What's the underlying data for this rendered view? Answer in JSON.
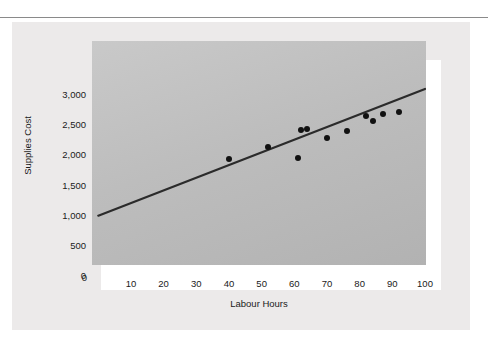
{
  "figure": {
    "title": "Scattergraph",
    "background_color": "#eceaea",
    "plot_fill_color": "#bdbdbd",
    "frame_color": "#ffffff",
    "point_color": "#111111",
    "line_color": "#2b2b2b"
  },
  "chart_data": {
    "type": "scatter",
    "title": "Scattergraph",
    "xlabel": "Labour Hours",
    "ylabel": "Supplies Cost",
    "xlim": [
      0,
      100
    ],
    "ylim": [
      0,
      3150
    ],
    "grid": false,
    "legend": "none",
    "xticks": [
      0,
      10,
      20,
      30,
      40,
      50,
      60,
      70,
      80,
      90,
      100
    ],
    "xticklabels": [
      "",
      "10",
      "20",
      "30",
      "40",
      "50",
      "60",
      "70",
      "80",
      "90",
      "100"
    ],
    "yticks": [
      0,
      500,
      1000,
      1500,
      2000,
      2500,
      3000
    ],
    "yticklabels": [
      "0",
      "500",
      "1,000",
      "1,500",
      "2,000",
      "2,500",
      "3,000"
    ],
    "points": [
      {
        "x": 40,
        "y": 1940
      },
      {
        "x": 52,
        "y": 2140
      },
      {
        "x": 61,
        "y": 1960
      },
      {
        "x": 62,
        "y": 2420
      },
      {
        "x": 64,
        "y": 2440
      },
      {
        "x": 70,
        "y": 2290
      },
      {
        "x": 76,
        "y": 2400
      },
      {
        "x": 82,
        "y": 2650
      },
      {
        "x": 84,
        "y": 2570
      },
      {
        "x": 87,
        "y": 2690
      },
      {
        "x": 92,
        "y": 2720
      }
    ],
    "trend_line": {
      "name": "line of best fit",
      "x_start": 0,
      "y_start": 1000,
      "x_end": 100,
      "y_end": 3100,
      "intercept": 1000,
      "slope": 21
    }
  }
}
